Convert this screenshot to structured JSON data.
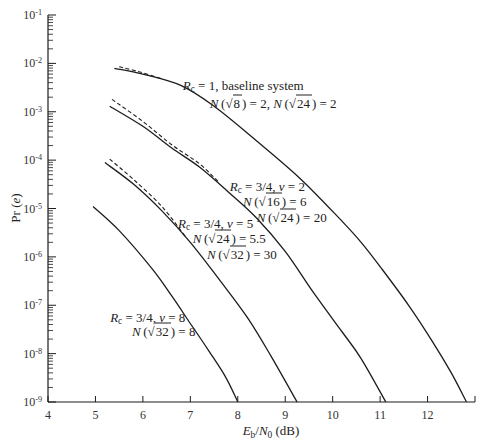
{
  "chart_data": {
    "type": "line",
    "title": "",
    "xlabel": "E_b/N_0 (dB)",
    "ylabel": "Pr (e)",
    "xscale": "linear",
    "yscale": "log",
    "xlim": [
      4,
      13
    ],
    "ylim": [
      1e-09,
      0.1
    ],
    "grid": false,
    "legend": null,
    "x_ticks": [
      4,
      5,
      6,
      7,
      8,
      9,
      10,
      11,
      12,
      13
    ],
    "x_tick_labels": [
      "4",
      "5",
      "6",
      "7",
      "8",
      "9",
      "10",
      "11",
      "12",
      ""
    ],
    "y_ticks": [
      0.1,
      0.01,
      0.001,
      0.0001,
      1e-05,
      1e-06,
      1e-07,
      1e-08,
      1e-09
    ],
    "y_tick_labels": [
      "10^-1",
      "10^-2",
      "10^-3",
      "10^-4",
      "10^-5",
      "10^-6",
      "10^-7",
      "10^-8",
      "10^-9"
    ],
    "series": [
      {
        "name": "R_c = 1, baseline system (bound)",
        "style": "solid",
        "points": [
          [
            5.4,
            0.0079
          ],
          [
            6.0,
            0.006
          ],
          [
            6.8,
            0.0035
          ],
          [
            7.5,
            0.0013
          ],
          [
            8.3,
            0.0003
          ],
          [
            9.3,
            4.3e-05
          ],
          [
            10.2,
            5.4e-06
          ],
          [
            10.6,
            2e-06
          ],
          [
            11.0,
            6.3e-07
          ],
          [
            11.6,
            1e-07
          ],
          [
            12.1,
            1.8e-08
          ],
          [
            12.5,
            4e-09
          ],
          [
            12.82,
            1e-09
          ]
        ]
      },
      {
        "name": "R_c = 1, baseline system (approx.)",
        "style": "dashed",
        "points": [
          [
            5.5,
            0.0085
          ],
          [
            5.9,
            0.0068
          ],
          [
            6.4,
            0.0048
          ]
        ]
      },
      {
        "name": "R_c = 3/4, v = 2 (bound)",
        "style": "solid",
        "points": [
          [
            5.3,
            0.0013
          ],
          [
            6.0,
            0.0005
          ],
          [
            6.6,
            0.00018
          ],
          [
            7.2,
            7.1e-05
          ],
          [
            7.8,
            2.2e-05
          ],
          [
            8.4,
            6.3e-06
          ],
          [
            9.0,
            1.3e-06
          ],
          [
            9.6,
            1.8e-07
          ],
          [
            10.2,
            2.8e-08
          ],
          [
            10.6,
            7.9e-09
          ],
          [
            11.12,
            1e-09
          ]
        ]
      },
      {
        "name": "R_c = 3/4, v = 2 (approx.)",
        "style": "dashed",
        "points": [
          [
            5.35,
            0.0018
          ],
          [
            6.0,
            0.00063
          ],
          [
            6.6,
            0.00021
          ],
          [
            7.2,
            8.3e-05
          ],
          [
            7.6,
            3.5e-05
          ]
        ]
      },
      {
        "name": "R_c = 3/4, v = 5 (bound)",
        "style": "solid",
        "points": [
          [
            5.2,
            8.9e-05
          ],
          [
            5.8,
            3.2e-05
          ],
          [
            6.4,
            8.9e-06
          ],
          [
            7.0,
            2e-06
          ],
          [
            7.6,
            3.5e-07
          ],
          [
            8.2,
            5.6e-08
          ],
          [
            8.7,
            8.9e-09
          ],
          [
            9.25,
            1e-09
          ]
        ]
      },
      {
        "name": "R_c = 3/4, v = 5 (approx.)",
        "style": "dashed",
        "points": [
          [
            5.3,
            0.000105
          ],
          [
            5.8,
            4e-05
          ],
          [
            6.4,
            1.1e-05
          ],
          [
            6.9,
            2.6e-06
          ]
        ]
      },
      {
        "name": "R_c = 3/4, v = 8 (bound)",
        "style": "solid",
        "points": [
          [
            4.95,
            1.1e-05
          ],
          [
            5.5,
            3.5e-06
          ],
          [
            6.2,
            5.6e-07
          ],
          [
            6.6,
            1.6e-07
          ],
          [
            7.0,
            4.2e-08
          ],
          [
            7.4,
            1.1e-08
          ],
          [
            7.75,
            3.2e-09
          ],
          [
            8.0,
            1e-09
          ]
        ]
      }
    ],
    "annotations": [
      {
        "id": "baseline",
        "lines": [
          {
            "text": "R_c = 1, baseline system",
            "x": 6.84,
            "y": 0.0035
          },
          {
            "text": "N(√8) = 2, N(√24) = 2",
            "x": 7.41,
            "y": 0.0015
          }
        ]
      },
      {
        "id": "v2",
        "lines": [
          {
            "text": "R_c = 3/4, v = 2",
            "x": 7.83,
            "y": 2.9e-05
          },
          {
            "text": "N(√16) = 6",
            "x": 8.11,
            "y": 1.4e-05
          },
          {
            "text": "N(√24) = 20",
            "x": 8.4,
            "y": 6.8e-06
          }
        ]
      },
      {
        "id": "v5",
        "lines": [
          {
            "text": "R_c = 3/4, v = 5",
            "x": 6.74,
            "y": 4.9e-06
          },
          {
            "text": "N(√24) = 5.5",
            "x": 7.05,
            "y": 2.4e-06
          },
          {
            "text": "N(√32) = 30",
            "x": 7.35,
            "y": 1.15e-06
          }
        ]
      },
      {
        "id": "v8",
        "lines": [
          {
            "text": "R_c = 3/4, v = 8",
            "x": 5.31,
            "y": 5.6e-08
          },
          {
            "text": "N(√32) = 8",
            "x": 5.77,
            "y": 2.9e-08
          }
        ]
      }
    ]
  },
  "colors": {
    "line": "#1c1c1c",
    "text": "#222222",
    "background": "#ffffff"
  }
}
